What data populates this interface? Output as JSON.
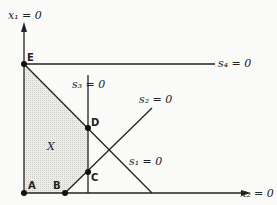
{
  "diagram": {
    "axes": {
      "vertical_label": "x₁ = 0",
      "horizontal_label": "x₂ = 0"
    },
    "constraints": [
      {
        "id": "s1",
        "label": "s₁ = 0"
      },
      {
        "id": "s2",
        "label": "s₂ = 0"
      },
      {
        "id": "s3",
        "label": "s₃ = 0"
      },
      {
        "id": "s4",
        "label": "s₄ = 0"
      }
    ],
    "points": [
      {
        "id": "A",
        "label": "A"
      },
      {
        "id": "B",
        "label": "B"
      },
      {
        "id": "C",
        "label": "C"
      },
      {
        "id": "D",
        "label": "D"
      },
      {
        "id": "E",
        "label": "E"
      }
    ],
    "region_label": "X",
    "colors": {
      "line": "#222222",
      "region_fill": "#e4e4e0"
    }
  }
}
